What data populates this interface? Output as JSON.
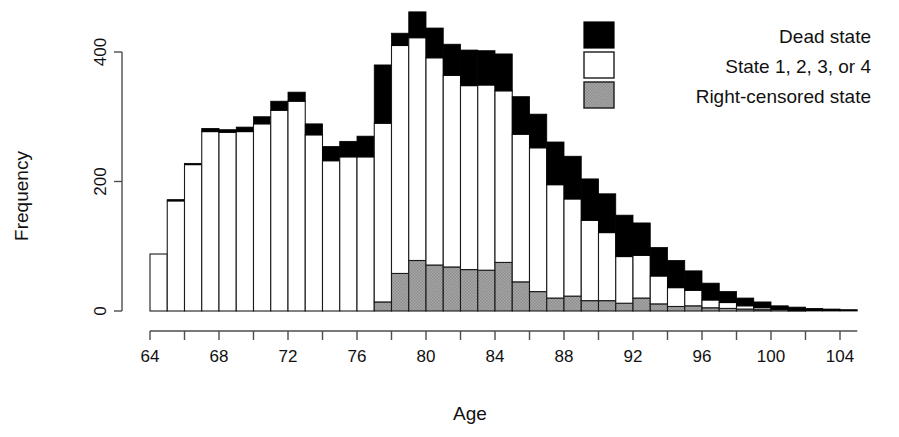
{
  "chart_data": {
    "type": "bar",
    "subtype": "stacked-histogram",
    "title": "",
    "xlabel": "Age",
    "ylabel": "Frequency",
    "xlim": [
      63,
      105
    ],
    "ylim": [
      0,
      440
    ],
    "x_ticks": [
      64,
      66,
      68,
      70,
      72,
      74,
      76,
      78,
      80,
      82,
      84,
      86,
      88,
      90,
      92,
      94,
      96,
      98,
      100,
      102,
      104
    ],
    "x_tick_labels": [
      "64",
      "",
      "68",
      "",
      "72",
      "",
      "76",
      "",
      "80",
      "",
      "84",
      "",
      "88",
      "",
      "92",
      "",
      "96",
      "",
      "100",
      "",
      "104"
    ],
    "y_ticks": [
      0,
      200,
      400
    ],
    "y_tick_labels": [
      "0",
      "200",
      "400"
    ],
    "grid": false,
    "legend_position": "top-right",
    "bin_width": 1,
    "categories": [
      64,
      65,
      66,
      67,
      68,
      69,
      70,
      71,
      72,
      73,
      74,
      75,
      76,
      77,
      78,
      79,
      80,
      81,
      82,
      83,
      84,
      85,
      86,
      87,
      88,
      89,
      90,
      91,
      92,
      93,
      94,
      95,
      96,
      97,
      98,
      99,
      100,
      101,
      102,
      103,
      104
    ],
    "series": [
      {
        "name": "Right-censored state",
        "color": "#9e9e9e",
        "values": [
          0,
          0,
          0,
          0,
          0,
          0,
          0,
          0,
          0,
          0,
          0,
          0,
          0,
          14,
          58,
          78,
          71,
          68,
          64,
          63,
          75,
          45,
          30,
          20,
          23,
          16,
          16,
          12,
          20,
          11,
          7,
          8,
          5,
          4,
          3,
          2,
          0,
          0,
          0,
          0,
          0
        ]
      },
      {
        "name": "State 1, 2, 3, or 4",
        "color": "#ffffff",
        "values": [
          88,
          170,
          226,
          277,
          276,
          277,
          289,
          310,
          324,
          272,
          232,
          238,
          238,
          276,
          352,
          344,
          320,
          296,
          284,
          286,
          265,
          228,
          222,
          175,
          150,
          124,
          105,
          72,
          66,
          43,
          29,
          24,
          12,
          9,
          5,
          3,
          2,
          1,
          0,
          0,
          0
        ]
      },
      {
        "name": "Dead state",
        "color": "#000000",
        "values": [
          0,
          2,
          2,
          5,
          4,
          7,
          11,
          14,
          14,
          17,
          22,
          24,
          32,
          90,
          19,
          40,
          46,
          48,
          55,
          53,
          57,
          58,
          52,
          66,
          66,
          64,
          60,
          64,
          50,
          44,
          42,
          30,
          26,
          17,
          12,
          9,
          6,
          5,
          4,
          3,
          2
        ]
      }
    ],
    "legend": [
      {
        "label": "Dead state",
        "swatch": "black-filled"
      },
      {
        "label": "State 1, 2, 3, or 4",
        "swatch": "white-filled"
      },
      {
        "label": "Right-censored state",
        "swatch": "gray-hatched"
      }
    ],
    "colors": {
      "dead": "#000000",
      "alive": "#ffffff",
      "censored": "#9e9e9e",
      "axis": "#4d4d4d",
      "text": "#111111"
    }
  }
}
